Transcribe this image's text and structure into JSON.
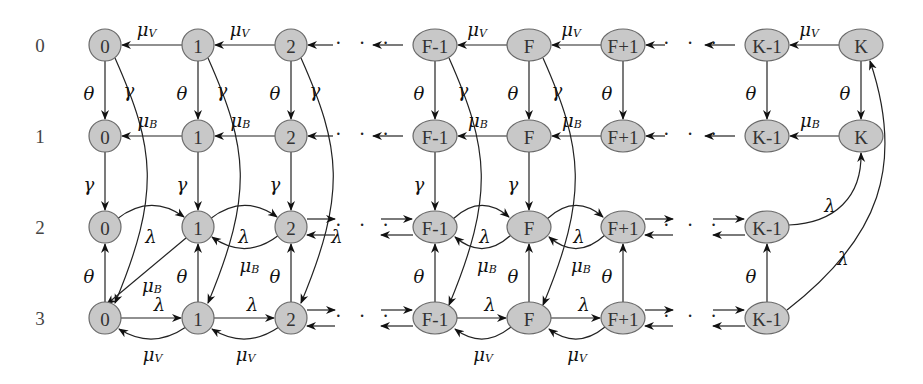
{
  "diagram": {
    "type": "state-transition-diagram",
    "rows": [
      "0",
      "1",
      "2",
      "3"
    ],
    "columns": [
      "0",
      "1",
      "2",
      "F-1",
      "F",
      "F+1",
      "K-1",
      "K"
    ],
    "ellipsis": "· · ·",
    "rates": {
      "mu_V": {
        "base": "μ",
        "sub": "V"
      },
      "mu_B": {
        "base": "μ",
        "sub": "B"
      },
      "theta": "θ",
      "gamma": "γ",
      "lambda": "λ"
    },
    "row_contents": {
      "0": [
        "0",
        "1",
        "2",
        "F-1",
        "F",
        "F+1",
        "K-1",
        "K"
      ],
      "1": [
        "0",
        "1",
        "2",
        "F-1",
        "F",
        "F+1",
        "K-1",
        "K"
      ],
      "2": [
        "0",
        "1",
        "2",
        "F-1",
        "F",
        "F+1",
        "K-1"
      ],
      "3": [
        "0",
        "1",
        "2",
        "F-1",
        "F",
        "F+1",
        "K-1"
      ]
    },
    "colors": {
      "node_fill": "#c8c8c8",
      "node_stroke": "#6a6a6a",
      "edge": "#222222",
      "background": "#ffffff"
    }
  }
}
